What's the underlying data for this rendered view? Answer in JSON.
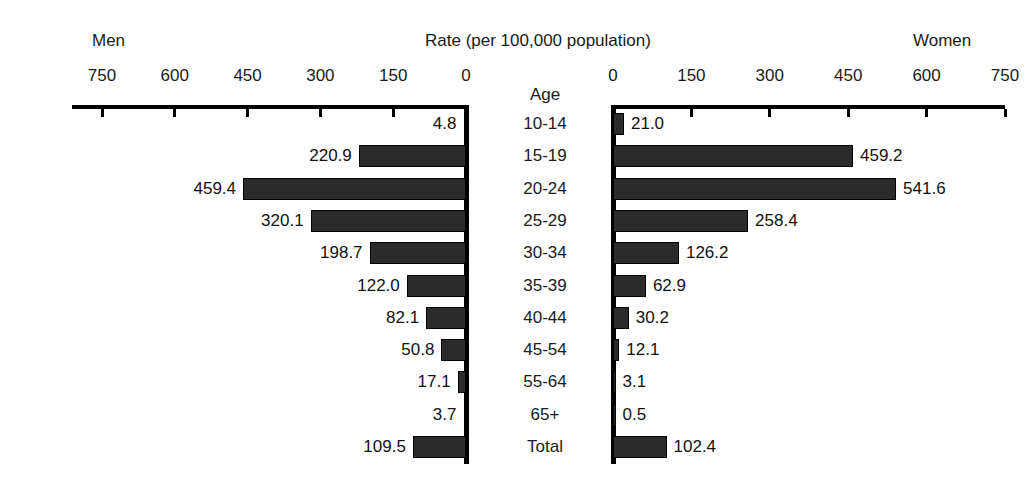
{
  "header": {
    "men_label": "Men",
    "rate_label": "Rate (per 100,000 population)",
    "women_label": "Women",
    "age_column_header": "Age"
  },
  "axis": {
    "left_ticks": [
      "750",
      "600",
      "450",
      "300",
      "150",
      "0"
    ],
    "right_ticks": [
      "0",
      "150",
      "300",
      "450",
      "600",
      "750"
    ]
  },
  "chart_data": {
    "type": "bar",
    "title": "Rate (per 100,000 population)",
    "subtype": "population-pyramid",
    "orientation": "horizontal-diverging",
    "xlabel": "Rate (per 100,000 population)",
    "ylabel": "Age",
    "xlim": [
      0,
      750
    ],
    "xticks": [
      0,
      150,
      300,
      450,
      600,
      750
    ],
    "grid": false,
    "legend": false,
    "categories": [
      "10-14",
      "15-19",
      "20-24",
      "25-29",
      "30-34",
      "35-39",
      "40-44",
      "45-54",
      "55-64",
      "65+",
      "Total"
    ],
    "series": [
      {
        "name": "Men",
        "side": "left",
        "values": [
          4.8,
          220.9,
          459.4,
          320.1,
          198.7,
          122.0,
          82.1,
          50.8,
          17.1,
          3.7,
          109.5
        ],
        "labels": [
          "4.8",
          "220.9",
          "459.4",
          "320.1",
          "198.7",
          "122.0",
          "82.1",
          "50.8",
          "17.1",
          "3.7",
          "109.5"
        ]
      },
      {
        "name": "Women",
        "side": "right",
        "values": [
          21.0,
          459.2,
          541.6,
          258.4,
          126.2,
          62.9,
          30.2,
          12.1,
          3.1,
          0.5,
          102.4
        ],
        "labels": [
          "21.0",
          "459.2",
          "541.6",
          "258.4",
          "126.2",
          "62.9",
          "30.2",
          "12.1",
          "3.1",
          "0.5",
          "102.4"
        ]
      }
    ],
    "colors": {
      "bar": "#2b2b2b",
      "axis": "#000000",
      "background": "#ffffff"
    }
  }
}
